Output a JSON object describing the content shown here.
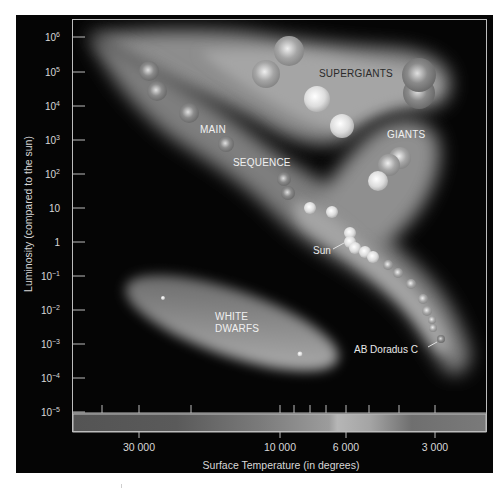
{
  "diagram": {
    "type": "Hertzsprung-Russell diagram",
    "colors": {
      "background": "#050505",
      "frame": "#bdbdbd",
      "text": "#d8d8d8",
      "band": "#9a9a9a"
    },
    "axes": {
      "y_title": "Luminosity (compared to the sun)",
      "x_title": "Surface Temperature (in degrees)",
      "y_ticks": [
        {
          "base": "10",
          "exp": "6",
          "y": 37
        },
        {
          "base": "10",
          "exp": "5",
          "y": 72
        },
        {
          "base": "10",
          "exp": "4",
          "y": 106
        },
        {
          "base": "10",
          "exp": "3",
          "y": 140
        },
        {
          "base": "10",
          "exp": "2",
          "y": 174
        },
        {
          "base": "10",
          "exp": "",
          "y": 208
        },
        {
          "base": "1",
          "exp": "",
          "y": 242
        },
        {
          "base": "10",
          "exp": "−1",
          "y": 276
        },
        {
          "base": "10",
          "exp": "−2",
          "y": 310
        },
        {
          "base": "10",
          "exp": "−3",
          "y": 344
        },
        {
          "base": "10",
          "exp": "−4",
          "y": 378
        },
        {
          "base": "10",
          "exp": "−5",
          "y": 412
        }
      ],
      "x_labels": [
        {
          "text": "30 000",
          "x": 139
        },
        {
          "text": "10 000",
          "x": 280
        },
        {
          "text": "6 000",
          "x": 346
        },
        {
          "text": "3 000",
          "x": 435
        }
      ],
      "x_minor_ticks": [
        102,
        139,
        191,
        280,
        294,
        310,
        326,
        346,
        369,
        399,
        435
      ]
    },
    "regions": [
      {
        "id": "supergiants",
        "label": "SUPERGIANTS",
        "x": 319,
        "y": 68,
        "dark": true
      },
      {
        "id": "giants",
        "label": "GIANTS",
        "x": 387,
        "y": 129,
        "dark": false
      },
      {
        "id": "main",
        "label": "MAIN",
        "x": 200,
        "y": 124,
        "dark": false
      },
      {
        "id": "sequence",
        "label": "SEQUENCE",
        "x": 233,
        "y": 157,
        "dark": false
      },
      {
        "id": "white1",
        "label": "WHITE",
        "x": 215,
        "y": 311,
        "dark": false
      },
      {
        "id": "white2",
        "label": "DWARFS",
        "x": 215,
        "y": 323,
        "dark": false
      }
    ],
    "star_labels": [
      {
        "id": "sun",
        "label": "Sun",
        "x": 313,
        "y": 245
      },
      {
        "id": "ab-doradus-c",
        "label": "AB Doradus C",
        "x": 354,
        "y": 344
      }
    ],
    "stars": [
      {
        "x": 289,
        "y": 51,
        "r": 15,
        "tone": "mid"
      },
      {
        "x": 266,
        "y": 74,
        "r": 14,
        "tone": "mid"
      },
      {
        "x": 317,
        "y": 99,
        "r": 13,
        "tone": "light"
      },
      {
        "x": 342,
        "y": 126,
        "r": 12,
        "tone": "light"
      },
      {
        "x": 419,
        "y": 93,
        "r": 16,
        "tone": "dim"
      },
      {
        "x": 419,
        "y": 75,
        "r": 17,
        "tone": "dim"
      },
      {
        "x": 400,
        "y": 158,
        "r": 11,
        "tone": "mid"
      },
      {
        "x": 389,
        "y": 165,
        "r": 11,
        "tone": "mid"
      },
      {
        "x": 378,
        "y": 181,
        "r": 10,
        "tone": "light"
      },
      {
        "x": 149,
        "y": 71,
        "r": 10,
        "tone": "dim"
      },
      {
        "x": 157,
        "y": 91,
        "r": 10,
        "tone": "dim"
      },
      {
        "x": 189,
        "y": 113,
        "r": 10,
        "tone": "dim"
      },
      {
        "x": 226,
        "y": 144,
        "r": 8,
        "tone": "dim"
      },
      {
        "x": 284,
        "y": 179,
        "r": 7,
        "tone": "dim"
      },
      {
        "x": 288,
        "y": 193,
        "r": 7,
        "tone": "dim"
      },
      {
        "x": 310,
        "y": 208,
        "r": 6,
        "tone": "light"
      },
      {
        "x": 332,
        "y": 212,
        "r": 6,
        "tone": "light"
      },
      {
        "x": 350,
        "y": 233,
        "r": 6,
        "tone": "light"
      },
      {
        "x": 350,
        "y": 242,
        "r": 6,
        "tone": "light"
      },
      {
        "x": 355,
        "y": 248,
        "r": 6,
        "tone": "light"
      },
      {
        "x": 365,
        "y": 252,
        "r": 6,
        "tone": "light"
      },
      {
        "x": 373,
        "y": 257,
        "r": 6,
        "tone": "light"
      },
      {
        "x": 388,
        "y": 265,
        "r": 5,
        "tone": "mid"
      },
      {
        "x": 398,
        "y": 273,
        "r": 5,
        "tone": "mid"
      },
      {
        "x": 411,
        "y": 284,
        "r": 5,
        "tone": "mid"
      },
      {
        "x": 423,
        "y": 299,
        "r": 5,
        "tone": "mid"
      },
      {
        "x": 427,
        "y": 311,
        "r": 5,
        "tone": "mid"
      },
      {
        "x": 432,
        "y": 320,
        "r": 4,
        "tone": "mid"
      },
      {
        "x": 433,
        "y": 328,
        "r": 4,
        "tone": "mid"
      },
      {
        "x": 441,
        "y": 339,
        "r": 4,
        "tone": "dim"
      },
      {
        "x": 163,
        "y": 298,
        "r": 2,
        "tone": "light"
      },
      {
        "x": 300,
        "y": 354,
        "r": 2.5,
        "tone": "light"
      }
    ]
  }
}
